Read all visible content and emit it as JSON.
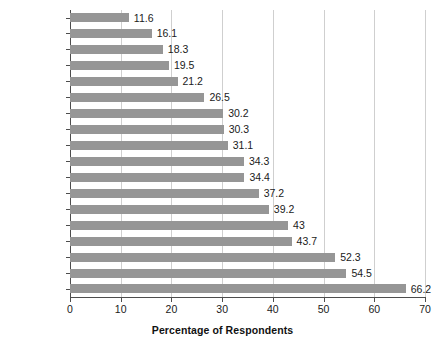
{
  "chart_data": {
    "type": "bar",
    "orientation": "horizontal",
    "title": "",
    "xlabel": "Percentage of Respondents",
    "ylabel": "",
    "xlim": [
      0,
      70
    ],
    "xticks": [
      0,
      10,
      20,
      30,
      40,
      50,
      60,
      70
    ],
    "xtick_labels": [
      "0",
      "10",
      "20",
      "30",
      "40",
      "50",
      "60",
      "70"
    ],
    "grid": true,
    "grid_axis": "x",
    "legend": false,
    "bar_color": "#969696",
    "grid_color": "#cfcfcf",
    "axis_color": "#4d4d4d",
    "data_labels": true,
    "categories": [
      "Chile",
      "Ecuador",
      "Guatemala",
      "Argentina",
      "Peru",
      "Mexico",
      "Brazil",
      "Panama",
      "Bolivia",
      "Venezuela",
      "El Salvador",
      "Colombia",
      "Paraguay",
      "Nicaragua",
      "Honduras",
      "Costa Rica",
      "Dom. Rep.",
      "Uruguay"
    ],
    "values": [
      11.6,
      16.1,
      18.3,
      19.5,
      21.2,
      26.5,
      30.2,
      30.3,
      31.1,
      34.3,
      34.4,
      37.2,
      39.2,
      43,
      43.7,
      52.3,
      54.5,
      66.2
    ],
    "value_labels": [
      "11.6",
      "16.1",
      "18.3",
      "19.5",
      "21.2",
      "26.5",
      "30.2",
      "30.3",
      "31.1",
      "34.3",
      "34.4",
      "37.2",
      "39.2",
      "43",
      "43.7",
      "52.3",
      "54.5",
      "66.2"
    ]
  }
}
